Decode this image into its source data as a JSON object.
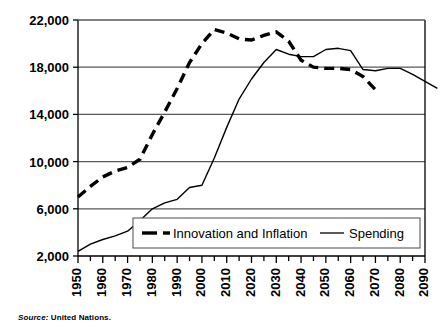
{
  "source_note": {
    "label": "Source:",
    "value": "United Nations."
  },
  "chart_data": {
    "type": "line",
    "title": "",
    "subtitle": "",
    "xlabel": "",
    "ylabel": "",
    "grid": true,
    "legend_position": "bottom-inside",
    "xlim": [
      1950,
      2090
    ],
    "ylim": [
      2000,
      22000
    ],
    "y_ticks": [
      2000,
      6000,
      10000,
      14000,
      18000,
      22000
    ],
    "y_tick_labels": [
      "2,000",
      "6,000",
      "10,000",
      "14,000",
      "18,000",
      "22,000"
    ],
    "x_ticks": [
      1950,
      1960,
      1970,
      1980,
      1990,
      2000,
      2010,
      2020,
      2030,
      2040,
      2050,
      2060,
      2070,
      2080,
      2090
    ],
    "x_tick_labels": [
      "1950",
      "1960",
      "1970",
      "1980",
      "1990",
      "2000",
      "2010",
      "2020",
      "2030",
      "2040",
      "2050",
      "2060",
      "2070",
      "2080",
      "2090"
    ],
    "x_minor_tick_step": 5,
    "series": [
      {
        "name": "Innovation and Inflation",
        "style": "dashed",
        "color": "#000000",
        "x": [
          1950,
          1955,
          1960,
          1965,
          1970,
          1975,
          1980,
          1985,
          1990,
          1995,
          2000,
          2005,
          2010,
          2015,
          2020,
          2025,
          2030,
          2035,
          2040,
          2045,
          2050,
          2055,
          2060,
          2065,
          2070
        ],
        "y": [
          7000,
          7900,
          8700,
          9200,
          9500,
          10200,
          12300,
          14200,
          16200,
          18400,
          20000,
          21200,
          20900,
          20400,
          20300,
          20700,
          21000,
          20200,
          18600,
          18000,
          17900,
          17900,
          17800,
          17200,
          16100
        ]
      },
      {
        "name": "Spending",
        "style": "solid",
        "color": "#000000",
        "x": [
          1950,
          1955,
          1960,
          1965,
          1970,
          1975,
          1980,
          1985,
          1990,
          1995,
          2000,
          2005,
          2010,
          2015,
          2020,
          2025,
          2030,
          2035,
          2040,
          2045,
          2050,
          2055,
          2060,
          2065,
          2070,
          2075,
          2080,
          2085,
          2090,
          2095
        ],
        "y": [
          2400,
          3000,
          3400,
          3700,
          4100,
          5000,
          6000,
          6500,
          6800,
          7800,
          8000,
          10300,
          12900,
          15300,
          17000,
          18400,
          19500,
          19100,
          18900,
          18900,
          19500,
          19600,
          19400,
          17800,
          17700,
          17900,
          17900,
          17400,
          16800,
          16200
        ]
      }
    ],
    "legend_entries": [
      {
        "label": "Innovation and Inflation",
        "style": "dashed"
      },
      {
        "label": "Spending",
        "style": "solid"
      }
    ]
  }
}
